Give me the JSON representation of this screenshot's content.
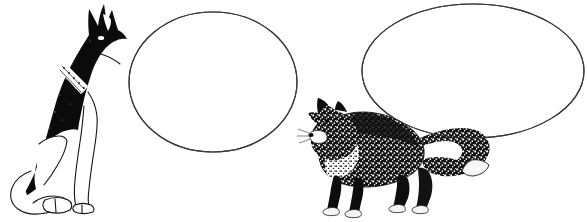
{
  "canvas": {
    "width": 587,
    "height": 222,
    "background_color": "#ffffff",
    "ink_color": "#0b0b0b",
    "outline_color": "#3a3a3a",
    "style": "black-and-white line art / halftone clip-art on plain white background",
    "visible_text": ""
  },
  "figures": [
    {
      "id": "dog",
      "name": "sitting-dog",
      "label": "Dog",
      "description": "Sitting German Shepherd style dog, drawn in solid black ink with white chest, white front legs, white paws and a light studded collar. Facing right with pointed upright ears, open mouth and visible tongue.",
      "bbox": {
        "x": 8,
        "y": 2,
        "width": 124,
        "height": 214
      },
      "fill_color": "#0b0b0b",
      "facing": "right",
      "features": [
        "pointed-ears",
        "studded-collar",
        "open-mouth",
        "white-chest",
        "white-paws",
        "bushy-tail"
      ]
    },
    {
      "id": "fox",
      "name": "walking-fox",
      "label": "Fox",
      "description": "Walking fox drawn in stippled / halftone black ink, facing left, with large triangular ears, white muzzle and throat, mottled body and a long thick tail with a white tip.",
      "bbox": {
        "x": 308,
        "y": 98,
        "width": 184,
        "height": 118
      },
      "fill_color": "#0b0b0b",
      "facing": "left",
      "features": [
        "triangular-ears",
        "white-muzzle",
        "stippled-coat",
        "long-bushy-tail",
        "white-tail-tip"
      ]
    }
  ],
  "speech_bubbles": [
    {
      "id": "bubble-dog",
      "name": "dog-speech-oval",
      "owner": "dog",
      "label": "Dog speech oval",
      "text": "",
      "placeholder": "",
      "shape": "ellipse",
      "empty": true,
      "stroke_color": "#3a3a3a",
      "fill_color": "#ffffff",
      "bbox": {
        "x": 129,
        "y": 12,
        "width": 168,
        "height": 141
      },
      "center": {
        "cx": 213,
        "cy": 82
      },
      "radii": {
        "rx": 84,
        "ry": 70
      }
    },
    {
      "id": "bubble-fox",
      "name": "fox-speech-oval",
      "owner": "fox",
      "label": "Fox speech oval",
      "text": "",
      "placeholder": "",
      "shape": "ellipse",
      "empty": true,
      "stroke_color": "#3a3a3a",
      "fill_color": "#ffffff",
      "bbox": {
        "x": 362,
        "y": 4,
        "width": 222,
        "height": 134
      },
      "center": {
        "cx": 473,
        "cy": 71
      },
      "radii": {
        "rx": 111,
        "ry": 67
      }
    }
  ]
}
